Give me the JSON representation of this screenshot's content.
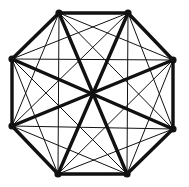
{
  "diagram": {
    "type": "complete-graph",
    "name": "K8",
    "vertex_count": 8,
    "edge_count": 28,
    "colors": {
      "background": "#ffffff",
      "stroke": "#111111",
      "vertex": "#111111"
    },
    "vertices": [
      {
        "id": 0,
        "x": 59,
        "y": 13
      },
      {
        "id": 1,
        "x": 128,
        "y": 13
      },
      {
        "id": 2,
        "x": 173,
        "y": 60
      },
      {
        "id": 3,
        "x": 173,
        "y": 129
      },
      {
        "id": 4,
        "x": 127,
        "y": 174
      },
      {
        "id": 5,
        "x": 58,
        "y": 174
      },
      {
        "id": 6,
        "x": 12,
        "y": 126
      },
      {
        "id": 7,
        "x": 12,
        "y": 59
      }
    ],
    "styles": {
      "perimeter_width": 3.4,
      "main_diagonal_width": 3.4,
      "chord_width": 1.0,
      "vertex_radius": 3.6
    }
  }
}
